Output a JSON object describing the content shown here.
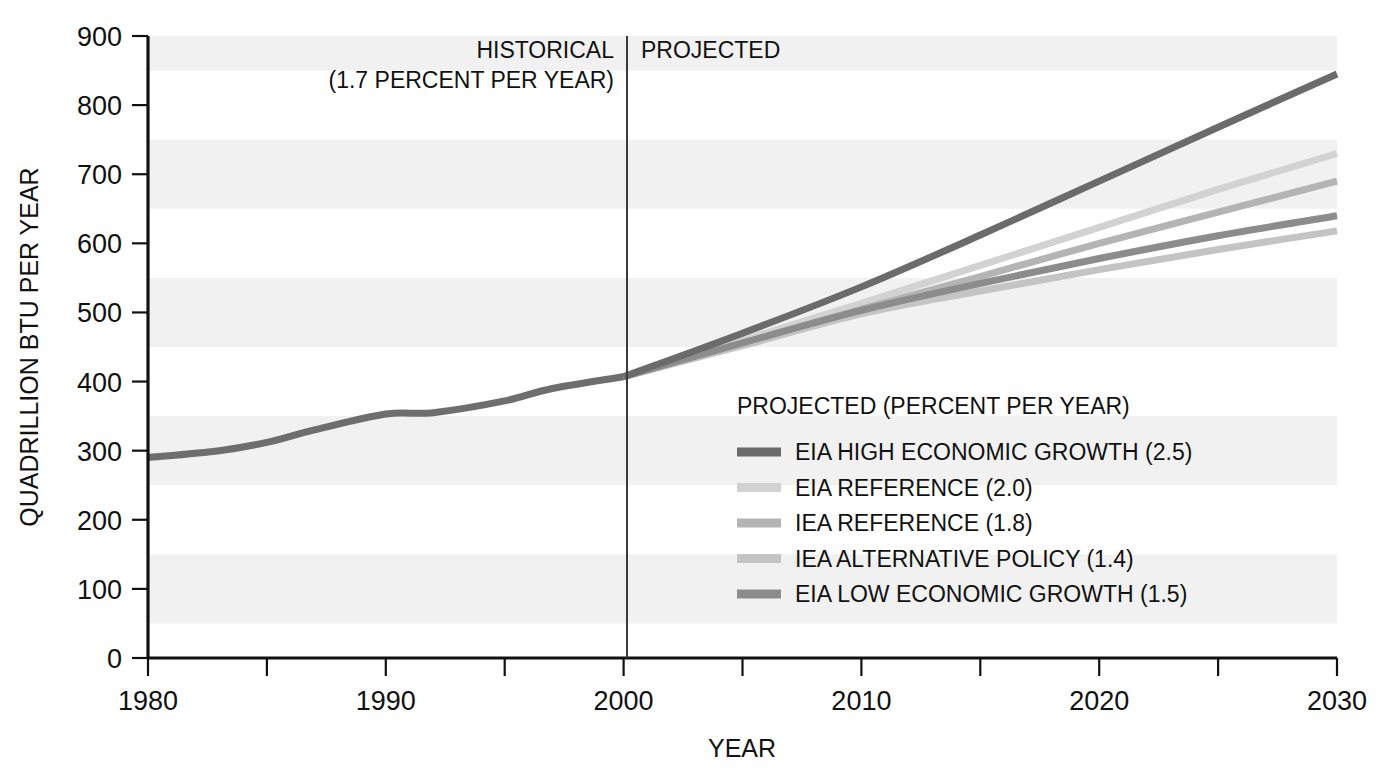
{
  "figure": {
    "background": "#ffffff",
    "band_color": "#f1f1f1"
  },
  "axes": {
    "y_axis_title": "QUADRILLION BTU PER YEAR",
    "x_axis_title": "YEAR",
    "y_ticks": [
      "0",
      "100",
      "200",
      "300",
      "400",
      "500",
      "600",
      "700",
      "800",
      "900"
    ],
    "x_ticks": [
      "1980",
      "1990",
      "2000",
      "2010",
      "2020",
      "2030"
    ],
    "x_minor_ticks": [
      "1985",
      "1995",
      "2005",
      "2015",
      "2025"
    ],
    "ylim": [
      0,
      900
    ],
    "xlim": [
      1980,
      2030
    ]
  },
  "annotations": {
    "historical_line1": "HISTORICAL",
    "historical_line2": "(1.7 PERCENT PER YEAR)",
    "projected_label": "PROJECTED",
    "divider_year": "2000"
  },
  "legend": {
    "title": "PROJECTED (PERCENT PER YEAR)",
    "entries": [
      {
        "label": "EIA HIGH ECONOMIC GROWTH (2.5)",
        "color": "#6b6b6b"
      },
      {
        "label": "EIA REFERENCE (2.0)",
        "color": "#d2d2d2"
      },
      {
        "label": "IEA REFERENCE (1.8)",
        "color": "#b4b4b4"
      },
      {
        "label": "IEA ALTERNATIVE POLICY (1.4)",
        "color": "#c4c4c4"
      },
      {
        "label": "EIA LOW ECONOMIC GROWTH (1.5)",
        "color": "#8c8c8c"
      }
    ]
  },
  "chart_data": {
    "type": "line",
    "title": "",
    "subtitle": "",
    "xlabel": "YEAR",
    "ylabel": "QUADRILLION BTU PER YEAR",
    "xlim": [
      1980,
      2030
    ],
    "ylim": [
      0,
      900
    ],
    "grid": "horizontal-alternating-bands",
    "legend_position": "inside-center-right",
    "historical_growth_percent_per_year": 1.7,
    "divider_year": 2000,
    "series": [
      {
        "name": "HISTORICAL",
        "color": "#6e6e6e",
        "x": [
          1980,
          1983,
          1985,
          1987,
          1990,
          1992,
          1995,
          1997,
          2000
        ],
        "values": [
          290,
          300,
          312,
          330,
          353,
          355,
          372,
          390,
          407
        ]
      },
      {
        "name": "EIA HIGH ECONOMIC GROWTH (2.5)",
        "color": "#6b6b6b",
        "x": [
          2000,
          2005,
          2010,
          2015,
          2020,
          2025,
          2030
        ],
        "values": [
          407,
          470,
          537,
          612,
          690,
          768,
          845
        ]
      },
      {
        "name": "EIA REFERENCE (2.0)",
        "color": "#d2d2d2",
        "x": [
          2000,
          2005,
          2010,
          2015,
          2020,
          2025,
          2030
        ],
        "values": [
          407,
          460,
          513,
          568,
          623,
          678,
          730
        ]
      },
      {
        "name": "IEA REFERENCE (1.8)",
        "color": "#b4b4b4",
        "x": [
          2000,
          2005,
          2010,
          2015,
          2020,
          2025,
          2030
        ],
        "values": [
          407,
          455,
          505,
          552,
          600,
          645,
          690
        ]
      },
      {
        "name": "IEA ALTERNATIVE POLICY (1.4)",
        "color": "#c4c4c4",
        "x": [
          2000,
          2005,
          2010,
          2015,
          2020,
          2025,
          2030
        ],
        "values": [
          407,
          452,
          498,
          531,
          562,
          591,
          618
        ]
      },
      {
        "name": "EIA LOW ECONOMIC GROWTH (1.5)",
        "color": "#8c8c8c",
        "x": [
          2000,
          2005,
          2010,
          2015,
          2020,
          2025,
          2030
        ],
        "values": [
          407,
          456,
          503,
          542,
          578,
          611,
          640
        ]
      }
    ]
  }
}
